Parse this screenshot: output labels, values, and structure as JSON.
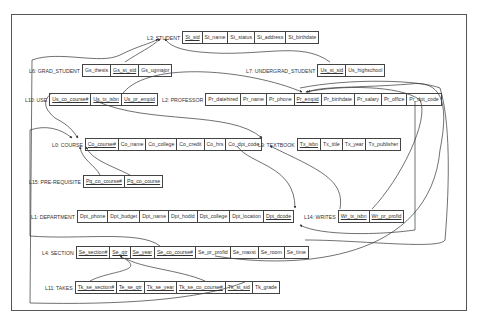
{
  "diagram": {
    "type": "relational-schema-referential-integrity",
    "relations": [
      {
        "id": "student",
        "label": "L3: STUDENT",
        "x": 147,
        "y": 31,
        "fields": [
          {
            "name": "St_sid",
            "key": true
          },
          {
            "name": "St_name",
            "key": false
          },
          {
            "name": "St_status",
            "key": false
          },
          {
            "name": "St_address",
            "key": false
          },
          {
            "name": "St_birthdate",
            "key": false
          }
        ]
      },
      {
        "id": "grad_student",
        "label": "L6: GRAD_STUDENT",
        "x": 29,
        "y": 64,
        "fields": [
          {
            "name": "Gs_thesis",
            "key": false
          },
          {
            "name": "Gs_st_sid",
            "key": true
          },
          {
            "name": "Gs_ugmajor",
            "key": false
          }
        ]
      },
      {
        "id": "undergrad_student",
        "label": "L7: UNDERGRAD_STUDENT",
        "x": 246,
        "y": 64,
        "fields": [
          {
            "name": "Us_st_sid",
            "key": true
          },
          {
            "name": "Us_highschool",
            "key": false
          }
        ]
      },
      {
        "id": "use",
        "label": "L10: USE",
        "x": 25,
        "y": 93,
        "fields": [
          {
            "name": "Us_co_course#",
            "key": true
          },
          {
            "name": "Us_tx_isbn",
            "key": true
          },
          {
            "name": "Us_pr_empid",
            "key": true
          }
        ]
      },
      {
        "id": "professor",
        "label": "L2: PROFESSOR",
        "x": 162,
        "y": 93,
        "fields": [
          {
            "name": "Pr_datehired",
            "key": false
          },
          {
            "name": "Pr_name",
            "key": false
          },
          {
            "name": "Pr_phone",
            "key": false
          },
          {
            "name": "Pr_empid",
            "key": true
          },
          {
            "name": "Pr_birthdate",
            "key": false
          },
          {
            "name": "Pr_salary",
            "key": false
          },
          {
            "name": "Pr_office",
            "key": false
          },
          {
            "name": "Pr_dpt_code",
            "key": false
          }
        ]
      },
      {
        "id": "course",
        "label": "L0: COURSE",
        "x": 52,
        "y": 138,
        "fields": [
          {
            "name": "Co_course#",
            "key": true
          },
          {
            "name": "Co_name",
            "key": false
          },
          {
            "name": "Co_college",
            "key": false
          },
          {
            "name": "Co_credit",
            "key": false
          },
          {
            "name": "Co_hrs",
            "key": false
          },
          {
            "name": "Co_dpt_code",
            "key": false
          }
        ]
      },
      {
        "id": "textbook",
        "label": "L9: TEXTBOOK",
        "x": 258,
        "y": 138,
        "fields": [
          {
            "name": "Tx_isbn",
            "key": true
          },
          {
            "name": "Tx_title",
            "key": false
          },
          {
            "name": "Tx_year",
            "key": false
          },
          {
            "name": "Tx_publisher",
            "key": false
          }
        ]
      },
      {
        "id": "prerequisite",
        "label": "L15: PRE-REQUISITE",
        "x": 29,
        "y": 175,
        "fields": [
          {
            "name": "Pq_co_course#",
            "key": true
          },
          {
            "name": "Pq_co_course",
            "key": true
          }
        ]
      },
      {
        "id": "department",
        "label": "L1: DEPARTMENT",
        "x": 31,
        "y": 210,
        "fields": [
          {
            "name": "Dpt_phone",
            "key": false
          },
          {
            "name": "Dpt_budget",
            "key": false
          },
          {
            "name": "Dpt_name",
            "key": false
          },
          {
            "name": "Dpt_hodid",
            "key": false
          },
          {
            "name": "Dpt_college",
            "key": false
          },
          {
            "name": "Dpt_location",
            "key": false
          },
          {
            "name": "Dpt_dcode",
            "key": true
          }
        ]
      },
      {
        "id": "writes",
        "label": "L14: WRITES",
        "x": 304,
        "y": 210,
        "fields": [
          {
            "name": "Wr_tx_isbn",
            "key": true
          },
          {
            "name": "Wr_pr_profid",
            "key": true
          }
        ]
      },
      {
        "id": "section",
        "label": "L4: SECTION",
        "x": 42,
        "y": 246,
        "fields": [
          {
            "name": "Se_section#",
            "key": true
          },
          {
            "name": "Se_qtr",
            "key": true
          },
          {
            "name": "Se_year",
            "key": true
          },
          {
            "name": "Se_co_course#",
            "key": true
          },
          {
            "name": "Se_pr_profid",
            "key": false
          },
          {
            "name": "Se_maxst",
            "key": false
          },
          {
            "name": "Se_room",
            "key": false
          },
          {
            "name": "Se_time",
            "key": false
          }
        ]
      },
      {
        "id": "takes",
        "label": "L11: TAKES",
        "x": 45,
        "y": 281,
        "fields": [
          {
            "name": "Tk_se_section#",
            "key": true
          },
          {
            "name": "Te_se_qtr",
            "key": true
          },
          {
            "name": "Tk_se_year",
            "key": true
          },
          {
            "name": "Tk_se_co_course#",
            "key": true
          },
          {
            "name": "Tk_st_sid",
            "key": true
          },
          {
            "name": "Tk_grade",
            "key": false
          }
        ]
      }
    ],
    "links": [
      {
        "from": "Gs_st_sid",
        "to": "St_sid"
      },
      {
        "from": "Us_st_sid",
        "to": "St_sid"
      },
      {
        "from": "Tk_st_sid",
        "to": "St_sid"
      },
      {
        "from": "Us_co_course#",
        "to": "Co_course#"
      },
      {
        "from": "Us_tx_isbn",
        "to": "Tx_isbn"
      },
      {
        "from": "Us_pr_empid",
        "to": "Pr_empid"
      },
      {
        "from": "Se_pr_profid",
        "to": "Pr_empid"
      },
      {
        "from": "Wr_pr_profid",
        "to": "Pr_empid"
      },
      {
        "from": "Pq_co_course#",
        "to": "Co_course#"
      },
      {
        "from": "Pq_co_course",
        "to": "Co_course#"
      },
      {
        "from": "Co_dpt_code",
        "to": "Dpt_dcode"
      },
      {
        "from": "Pr_dpt_code",
        "to": "Dpt_dcode"
      },
      {
        "from": "Wr_tx_isbn",
        "to": "Tx_isbn"
      },
      {
        "from": "Se_co_course#",
        "to": "Co_course#"
      },
      {
        "from": "Tk_se_section#",
        "to": "Se_section#"
      }
    ]
  }
}
